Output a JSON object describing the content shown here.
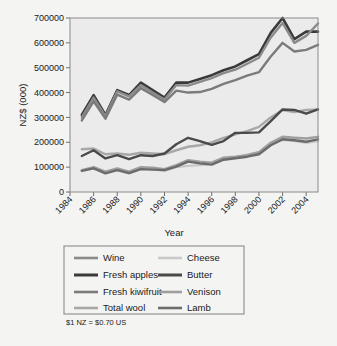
{
  "figure": {
    "background_color": "#f4f4f2",
    "plot_background_color": "#ebebeb",
    "frame_color": "#8a8a8a"
  },
  "footnote": {
    "text": "$1 NZ = $0.70 US"
  },
  "legend": {
    "border_color": "#8d8d8d",
    "columns": 2,
    "entries": [
      {
        "label": "Wine",
        "color": "#8a8a8a",
        "width": 2.6
      },
      {
        "label": "Cheese",
        "color": "#c9c9c9",
        "width": 2.6
      },
      {
        "label": "Fresh apples",
        "color": "#3a3a3a",
        "width": 3.0
      },
      {
        "label": "Butter",
        "color": "#4a4a4a",
        "width": 3.0
      },
      {
        "label": "Fresh kiwifruit",
        "color": "#7b7b7b",
        "width": 2.6
      },
      {
        "label": "Venison",
        "color": "#9e9e9e",
        "width": 2.6
      },
      {
        "label": "Total wool",
        "color": "#a8a8a8",
        "width": 2.6
      },
      {
        "label": "Lamb",
        "color": "#6b6b6b",
        "width": 2.6
      }
    ]
  },
  "chart_data": {
    "type": "line",
    "title": "",
    "xlabel": "Year",
    "ylabel": "NZ$ (000)",
    "xlim": [
      1984,
      2005
    ],
    "ylim": [
      0,
      700000
    ],
    "grid": false,
    "legend_position": "below",
    "xticks": [
      1984,
      1986,
      1988,
      1990,
      1992,
      1994,
      1996,
      1998,
      2000,
      2002,
      2004
    ],
    "xtick_labels": [
      "1984",
      "1986",
      "1988",
      "1990",
      "1992",
      "1994",
      "1996",
      "1998",
      "2000",
      "2002",
      "2004"
    ],
    "xtick_rotation": 45,
    "yticks": [
      0,
      100000,
      200000,
      300000,
      400000,
      500000,
      600000,
      700000
    ],
    "ytick_labels": [
      "0",
      "100000",
      "200000",
      "300000",
      "400000",
      "500000",
      "600000",
      "700000"
    ],
    "x": [
      1985,
      1986,
      1987,
      1988,
      1989,
      1990,
      1991,
      1992,
      1993,
      1994,
      1995,
      1996,
      1997,
      1998,
      1999,
      2000,
      2001,
      2002,
      2003,
      2004,
      2005
    ],
    "series": [
      {
        "name": "Fresh apples",
        "color": "#3a3a3a",
        "width": 2.6,
        "values": [
          310000,
          390000,
          310000,
          410000,
          390000,
          440000,
          410000,
          380000,
          440000,
          440000,
          455000,
          470000,
          490000,
          505000,
          530000,
          555000,
          640000,
          700000,
          615000,
          645000,
          645000
        ]
      },
      {
        "name": "Wine",
        "color": "#8a8a8a",
        "width": 2.4,
        "values": [
          300000,
          380000,
          305000,
          405000,
          385000,
          430000,
          400000,
          372000,
          430000,
          428000,
          443000,
          458000,
          478000,
          492000,
          516000,
          540000,
          622000,
          680000,
          600000,
          628000,
          678000
        ]
      },
      {
        "name": "Fresh kiwifruit",
        "color": "#7b7b7b",
        "width": 2.4,
        "values": [
          288000,
          365000,
          295000,
          392000,
          372000,
          418000,
          390000,
          362000,
          408000,
          400000,
          402000,
          415000,
          435000,
          450000,
          468000,
          482000,
          545000,
          600000,
          565000,
          572000,
          592000
        ]
      },
      {
        "name": "Total wool",
        "color": "#a8a8a8",
        "width": 2.4,
        "values": [
          172000,
          175000,
          152000,
          155000,
          150000,
          158000,
          155000,
          152000,
          168000,
          182000,
          188000,
          200000,
          218000,
          232000,
          245000,
          262000,
          300000,
          330000,
          322000,
          330000,
          332000
        ]
      },
      {
        "name": "Cheese",
        "color": "#c9c9c9",
        "width": 2.4,
        "values": [
          85000,
          98000,
          78000,
          88000,
          75000,
          95000,
          92000,
          85000,
          100000,
          105000,
          108000,
          112000,
          130000,
          138000,
          150000,
          160000,
          190000,
          210000,
          205000,
          198000,
          205000
        ]
      },
      {
        "name": "Butter",
        "color": "#4a4a4a",
        "width": 2.4,
        "values": [
          145000,
          168000,
          135000,
          148000,
          132000,
          148000,
          145000,
          155000,
          192000,
          218000,
          205000,
          190000,
          205000,
          238000,
          238000,
          240000,
          285000,
          332000,
          330000,
          315000,
          332000
        ]
      },
      {
        "name": "Venison",
        "color": "#9e9e9e",
        "width": 2.4,
        "values": [
          88000,
          100000,
          82000,
          95000,
          82000,
          100000,
          98000,
          92000,
          108000,
          128000,
          122000,
          118000,
          138000,
          142000,
          148000,
          160000,
          198000,
          222000,
          218000,
          215000,
          222000
        ]
      },
      {
        "name": "Lamb",
        "color": "#6b6b6b",
        "width": 2.4,
        "values": [
          85000,
          95000,
          75000,
          88000,
          76000,
          92000,
          90000,
          88000,
          102000,
          122000,
          115000,
          110000,
          130000,
          136000,
          142000,
          152000,
          188000,
          212000,
          208000,
          202000,
          212000
        ]
      }
    ]
  }
}
